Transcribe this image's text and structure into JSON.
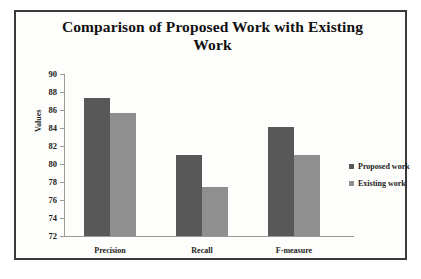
{
  "chart_data": {
    "type": "bar",
    "title": "Comparison of Proposed Work with Existing Work",
    "xlabel": "",
    "ylabel": "Values",
    "categories": [
      "Precision",
      "Recall",
      "F-measure"
    ],
    "series": [
      {
        "name": "Proposed work",
        "color": "#585858",
        "values": [
          87.3,
          81.0,
          84.1
        ]
      },
      {
        "name": "Existing work",
        "color": "#8f8f8f",
        "values": [
          85.7,
          77.5,
          81.0
        ]
      }
    ],
    "ylim": [
      72,
      90
    ],
    "ytick_step": 2,
    "yticks": [
      90,
      88,
      86,
      84,
      82,
      80,
      78,
      76,
      74,
      72
    ],
    "grid": false,
    "legend_position": "right"
  },
  "figure": {
    "border_color": "#3a3a38",
    "background": "#fdfdfb"
  }
}
